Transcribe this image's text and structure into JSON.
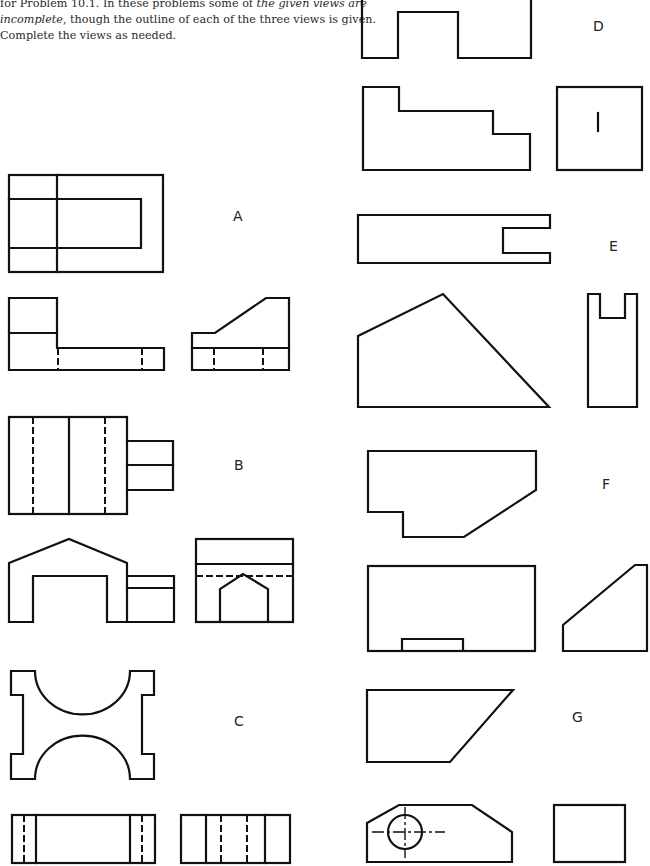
{
  "intro": {
    "line1_pre": "for Problem 10.1. In these problems some of ",
    "line1_em": "the given views are",
    "line2_em": "incomplete",
    "line2_post": ", though the outline of each of the three views is given.",
    "line3": "Complete the views as needed."
  },
  "problems": [
    {
      "id": "A",
      "label": "A",
      "label_pos": [
        240,
        220
      ]
    },
    {
      "id": "B",
      "label": "B",
      "label_pos": [
        240,
        469
      ]
    },
    {
      "id": "C",
      "label": "C",
      "label_pos": [
        240,
        726
      ]
    },
    {
      "id": "D",
      "label": "D",
      "label_pos": [
        593,
        30
      ]
    },
    {
      "id": "E",
      "label": "E",
      "label_pos": [
        608,
        250
      ]
    },
    {
      "id": "F",
      "label": "F",
      "label_pos": [
        604,
        488
      ]
    },
    {
      "id": "G",
      "label": "G",
      "label_pos": [
        578,
        722
      ]
    }
  ],
  "colors": {
    "ink": "#111111",
    "paper": "#ffffff",
    "text": "#2a2a2a"
  }
}
